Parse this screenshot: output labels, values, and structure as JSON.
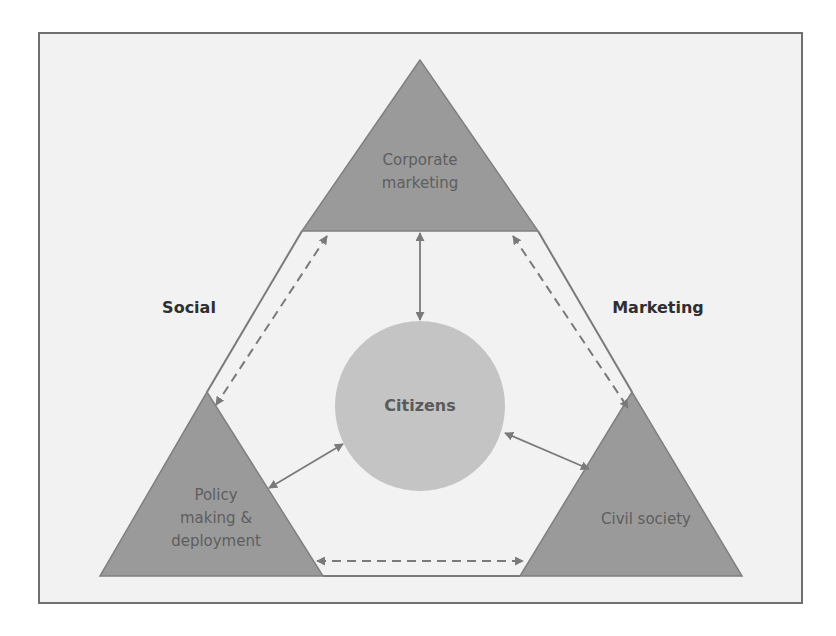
{
  "diagram": {
    "type": "triangular-stakeholder-diagram",
    "colors": {
      "background": "#f2f2f2",
      "frame_border": "#6f6f6f",
      "triangle_fill": "#9a9a9a",
      "circle_fill": "#c4c4c4",
      "arrow": "#7a7a7a",
      "outline": "#7a7a7a"
    },
    "nodes": {
      "top": {
        "line1": "Corporate",
        "line2": "marketing"
      },
      "bottom_left": {
        "line1": "Policy",
        "line2": "making &",
        "line3": "deployment"
      },
      "bottom_right": {
        "line1": "Civil society"
      },
      "center": {
        "label": "Citizens"
      }
    },
    "side_labels": {
      "left": "Social",
      "right": "Marketing"
    },
    "edges": [
      {
        "from": "Corporate marketing",
        "to": "Policy making & deployment",
        "style": "dashed",
        "direction": "both"
      },
      {
        "from": "Corporate marketing",
        "to": "Civil society",
        "style": "dashed",
        "direction": "both"
      },
      {
        "from": "Policy making & deployment",
        "to": "Civil society",
        "style": "dashed",
        "direction": "both"
      },
      {
        "from": "Corporate marketing",
        "to": "Citizens",
        "style": "solid",
        "direction": "both"
      },
      {
        "from": "Policy making & deployment",
        "to": "Citizens",
        "style": "solid",
        "direction": "both"
      },
      {
        "from": "Civil society",
        "to": "Citizens",
        "style": "solid",
        "direction": "both"
      }
    ]
  }
}
